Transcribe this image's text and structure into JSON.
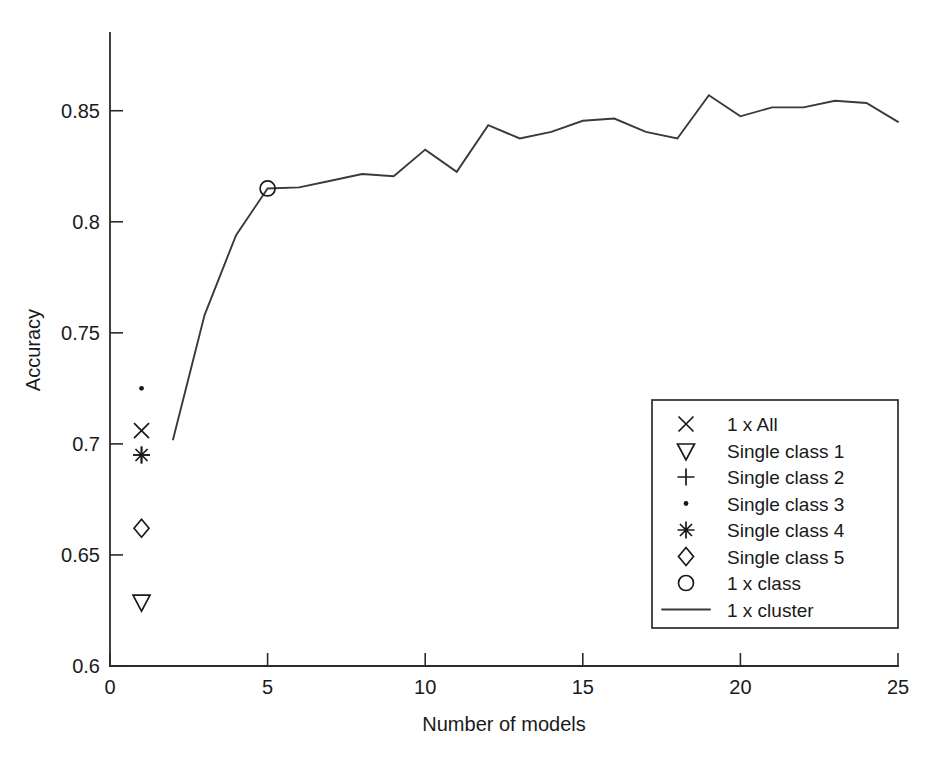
{
  "chart_data": {
    "type": "line",
    "title": "",
    "xlabel": "Number of models",
    "ylabel": "Accuracy",
    "xlim": [
      0,
      25
    ],
    "ylim": [
      0.6,
      0.885
    ],
    "xticks": [
      0,
      5,
      10,
      15,
      20,
      25
    ],
    "xticklabels": [
      "0",
      "5",
      "10",
      "15",
      "20",
      "25"
    ],
    "yticks": [
      0.6,
      0.65,
      0.7,
      0.75,
      0.8,
      0.85
    ],
    "yticklabels": [
      "0.6",
      "0.65",
      "0.7",
      "0.75",
      "0.8",
      "0.85"
    ],
    "grid": false,
    "legend_position": "lower right",
    "series": [
      {
        "name": "1 x All",
        "marker": "x",
        "style": "marker",
        "x": [
          1
        ],
        "values": [
          0.706
        ]
      },
      {
        "name": "Single class 1",
        "marker": "triangle-down",
        "style": "marker",
        "x": [
          1
        ],
        "values": [
          0.629
        ]
      },
      {
        "name": "Single class 2",
        "marker": "plus",
        "style": "marker",
        "x": [
          1
        ],
        "values": [
          0.695
        ]
      },
      {
        "name": "Single class 3",
        "marker": "dot",
        "style": "marker",
        "x": [
          1
        ],
        "values": [
          0.725
        ]
      },
      {
        "name": "Single class 4",
        "marker": "asterisk",
        "style": "marker",
        "x": [
          1
        ],
        "values": [
          0.695
        ]
      },
      {
        "name": "Single class 5",
        "marker": "diamond",
        "style": "marker",
        "x": [
          1
        ],
        "values": [
          0.662
        ]
      },
      {
        "name": "1 x class",
        "marker": "circle",
        "style": "marker",
        "x": [
          5
        ],
        "values": [
          0.815
        ]
      },
      {
        "name": "1 x cluster",
        "marker": "none",
        "style": "line",
        "x": [
          2,
          3,
          4,
          5,
          6,
          7,
          8,
          9,
          10,
          11,
          12,
          13,
          14,
          15,
          16,
          17,
          18,
          19,
          20,
          21,
          22,
          23,
          24,
          25
        ],
        "values": [
          0.702,
          0.758,
          0.794,
          0.815,
          0.8155,
          0.8185,
          0.8215,
          0.8205,
          0.8325,
          0.8225,
          0.8435,
          0.8375,
          0.8405,
          0.8455,
          0.8465,
          0.8405,
          0.8375,
          0.857,
          0.8475,
          0.8515,
          0.8515,
          0.8545,
          0.8535,
          0.845
        ]
      }
    ]
  },
  "legend": {
    "entries": [
      {
        "label": "1 x All",
        "marker": "x-marker"
      },
      {
        "label": "Single class 1",
        "marker": "triangle-down-marker"
      },
      {
        "label": "Single class 2",
        "marker": "plus-marker"
      },
      {
        "label": "Single class 3",
        "marker": "dot-marker"
      },
      {
        "label": "Single class 4",
        "marker": "asterisk-marker"
      },
      {
        "label": "Single class 5",
        "marker": "diamond-marker"
      },
      {
        "label": "1 x class",
        "marker": "circle-marker"
      },
      {
        "label": "1 x cluster",
        "marker": "line-sample"
      }
    ]
  },
  "colors": {
    "line": "#3a3a3a",
    "axis": "#2b2b2b",
    "text": "#1a1a1a",
    "background": "#ffffff"
  }
}
